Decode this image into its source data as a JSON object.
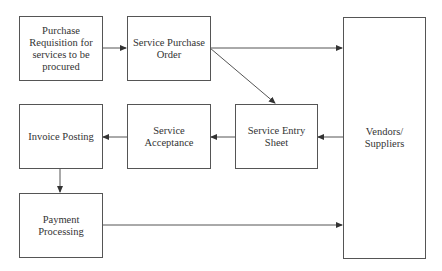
{
  "diagram": {
    "type": "flowchart",
    "nodes": {
      "requisition": {
        "label": "Purchase Requisition for services to be procured"
      },
      "purchase_order": {
        "label": "Service Purchase Order"
      },
      "vendors": {
        "label": "Vendors/ Suppliers"
      },
      "entry_sheet": {
        "label": "Service Entry Sheet"
      },
      "acceptance": {
        "label": "Service Acceptance"
      },
      "invoice": {
        "label": "Invoice Posting"
      },
      "payment": {
        "label": "Payment Processing"
      }
    },
    "edges": [
      {
        "from": "requisition",
        "to": "purchase_order"
      },
      {
        "from": "purchase_order",
        "to": "vendors"
      },
      {
        "from": "purchase_order",
        "to": "entry_sheet"
      },
      {
        "from": "vendors",
        "to": "entry_sheet"
      },
      {
        "from": "entry_sheet",
        "to": "acceptance"
      },
      {
        "from": "acceptance",
        "to": "invoice"
      },
      {
        "from": "invoice",
        "to": "payment"
      },
      {
        "from": "payment",
        "to": "vendors"
      }
    ],
    "colors": {
      "stroke": "#555555",
      "text": "#333333",
      "background": "#ffffff"
    }
  }
}
